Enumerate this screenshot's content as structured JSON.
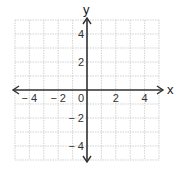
{
  "chart_data": {
    "type": "line",
    "title": "",
    "xlabel": "x",
    "ylabel": "y",
    "xlim": [
      -5,
      5
    ],
    "ylim": [
      -5,
      5
    ],
    "grid": true,
    "grid_step": 1,
    "x_ticks": [
      -4,
      -2,
      0,
      2,
      4
    ],
    "y_ticks": [
      4,
      2,
      -2,
      -4
    ],
    "x_tick_labels": [
      "− 4",
      "− 2",
      "0",
      "2",
      "4"
    ],
    "y_tick_labels": [
      "4",
      "2",
      "− 2",
      "− 4"
    ],
    "series": []
  },
  "axes": {
    "x_label": "x",
    "y_label": "y",
    "origin_label": "0"
  },
  "colors": {
    "grid": "#c8c8c8",
    "axis": "#333333",
    "background": "#ffffff"
  }
}
